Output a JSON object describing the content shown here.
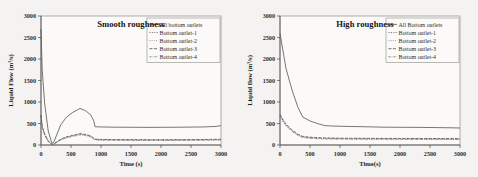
{
  "figure": {
    "background_color": "#f2f1ef",
    "panel_background": "#fbfaf9",
    "line_color": "#5d5d5d"
  },
  "panels": [
    {
      "id": "smooth",
      "title": "Smooth roughness",
      "xlabel": "Time (s)",
      "ylabel": "Liquid Flow (m³/s)",
      "xticks": [
        "0",
        "500",
        "1000",
        "1500",
        "2000",
        "2500",
        "3000"
      ],
      "yticks": [
        "0",
        "500",
        "1000",
        "1500",
        "2000",
        "2500",
        "3000"
      ],
      "legend": [
        "All bottom outlets",
        "Bottom outlet-1",
        "Bottom outlet-2",
        "Bottom outlet-3",
        "Bottom outlet-4"
      ]
    },
    {
      "id": "high",
      "title": "High roughness",
      "xlabel": "Time(s)",
      "ylabel": "Liquid flow (m³/s)",
      "xticks": [
        "0",
        "500",
        "1000",
        "1500",
        "2000",
        "2500",
        "3000"
      ],
      "yticks": [
        "0",
        "500",
        "1000",
        "1500",
        "2000",
        "2500",
        "3000"
      ],
      "legend": [
        "All Bottom outlets",
        "Bottom outlet-1",
        "Bottom outlet-2",
        "Bottom outlet-3",
        "Bottom outlet-4"
      ]
    }
  ],
  "chart_data": [
    {
      "type": "line",
      "title": "Smooth roughness",
      "xlabel": "Time (s)",
      "ylabel": "Liquid Flow (m³/s)",
      "xlim": [
        0,
        3000
      ],
      "ylim": [
        0,
        3000
      ],
      "xticks": [
        0,
        500,
        1000,
        1500,
        2000,
        2500,
        3000
      ],
      "yticks": [
        0,
        500,
        1000,
        1500,
        2000,
        2500,
        3000
      ],
      "grid": false,
      "legend_position": "top-right",
      "series": [
        {
          "name": "All bottom outlets",
          "x": [
            0,
            20,
            60,
            120,
            180,
            210,
            260,
            330,
            420,
            520,
            650,
            740,
            830,
            880,
            900,
            1000,
            1200,
            1500,
            1800,
            2100,
            2400,
            2700,
            2900,
            3000
          ],
          "y": [
            2700,
            1750,
            980,
            330,
            40,
            60,
            230,
            470,
            640,
            750,
            850,
            800,
            700,
            560,
            425,
            420,
            415,
            412,
            410,
            412,
            415,
            420,
            430,
            450
          ]
        },
        {
          "name": "Bottom outlet-1",
          "x": [
            0,
            20,
            60,
            120,
            180,
            210,
            260,
            330,
            420,
            520,
            650,
            740,
            830,
            900,
            1000,
            1200,
            1500,
            1800,
            2100,
            2400,
            2700,
            3000
          ],
          "y": [
            690,
            430,
            250,
            90,
            15,
            20,
            65,
            130,
            180,
            215,
            255,
            240,
            205,
            130,
            125,
            122,
            120,
            118,
            118,
            120,
            122,
            128
          ]
        },
        {
          "name": "Bottom outlet-2",
          "x": [
            0,
            20,
            60,
            120,
            180,
            210,
            260,
            330,
            420,
            520,
            650,
            740,
            830,
            900,
            1000,
            1200,
            1500,
            1800,
            2100,
            2400,
            2700,
            3000
          ],
          "y": [
            670,
            420,
            240,
            85,
            12,
            18,
            60,
            122,
            172,
            205,
            245,
            228,
            195,
            122,
            118,
            115,
            113,
            112,
            112,
            114,
            116,
            122
          ]
        },
        {
          "name": "Bottom outlet-3",
          "x": [
            0,
            20,
            60,
            120,
            180,
            210,
            260,
            330,
            420,
            520,
            650,
            740,
            830,
            900,
            1000,
            1200,
            1500,
            1800,
            2100,
            2400,
            2700,
            3000
          ],
          "y": [
            700,
            440,
            258,
            95,
            18,
            24,
            70,
            136,
            188,
            222,
            265,
            248,
            212,
            136,
            130,
            127,
            125,
            123,
            123,
            125,
            128,
            134
          ]
        },
        {
          "name": "Bottom outlet-4",
          "x": [
            0,
            20,
            60,
            120,
            180,
            210,
            260,
            330,
            420,
            520,
            650,
            740,
            830,
            900,
            1000,
            1200,
            1500,
            1800,
            2100,
            2400,
            2700,
            3000
          ],
          "y": [
            660,
            412,
            232,
            80,
            10,
            15,
            56,
            116,
            165,
            198,
            236,
            220,
            188,
            116,
            112,
            109,
            107,
            106,
            106,
            108,
            110,
            116
          ]
        }
      ]
    },
    {
      "type": "line",
      "title": "High roughness",
      "xlabel": "Time(s)",
      "ylabel": "Liquid flow (m³/s)",
      "xlim": [
        0,
        3000
      ],
      "ylim": [
        0,
        3000
      ],
      "xticks": [
        0,
        500,
        1000,
        1500,
        2000,
        2500,
        3000
      ],
      "yticks": [
        0,
        500,
        1000,
        1500,
        2000,
        2500,
        3000
      ],
      "grid": false,
      "legend_position": "top-right",
      "series": [
        {
          "name": "All Bottom outlets",
          "x": [
            0,
            30,
            100,
            200,
            300,
            380,
            500,
            620,
            750,
            900,
            1100,
            1400,
            1700,
            2000,
            2300,
            2600,
            2850,
            3000
          ],
          "y": [
            2600,
            2350,
            1780,
            1280,
            870,
            650,
            560,
            500,
            450,
            440,
            432,
            425,
            415,
            412,
            410,
            405,
            400,
            395
          ]
        },
        {
          "name": "Bottom outlet-1",
          "x": [
            0,
            30,
            100,
            200,
            300,
            380,
            500,
            620,
            750,
            900,
            1100,
            1400,
            1700,
            2000,
            2300,
            2600,
            2850,
            3000
          ],
          "y": [
            700,
            620,
            470,
            340,
            240,
            190,
            172,
            162,
            155,
            152,
            150,
            148,
            146,
            145,
            144,
            143,
            142,
            140
          ]
        },
        {
          "name": "Bottom outlet-2",
          "x": [
            0,
            30,
            100,
            200,
            300,
            380,
            500,
            620,
            750,
            900,
            1100,
            1400,
            1700,
            2000,
            2300,
            2600,
            2850,
            3000
          ],
          "y": [
            685,
            605,
            455,
            328,
            230,
            180,
            163,
            153,
            147,
            144,
            142,
            140,
            139,
            138,
            137,
            136,
            135,
            134
          ]
        },
        {
          "name": "Bottom outlet-3",
          "x": [
            0,
            30,
            100,
            200,
            300,
            380,
            500,
            620,
            750,
            900,
            1100,
            1400,
            1700,
            2000,
            2300,
            2600,
            2850,
            3000
          ],
          "y": [
            715,
            635,
            485,
            352,
            250,
            200,
            182,
            172,
            165,
            161,
            158,
            156,
            154,
            153,
            152,
            151,
            150,
            148
          ]
        },
        {
          "name": "Bottom outlet-4",
          "x": [
            0,
            30,
            100,
            200,
            300,
            380,
            500,
            620,
            750,
            900,
            1100,
            1400,
            1700,
            2000,
            2300,
            2600,
            2850,
            3000
          ],
          "y": [
            672,
            592,
            443,
            316,
            220,
            172,
            155,
            146,
            140,
            137,
            135,
            133,
            132,
            131,
            130,
            129,
            128,
            127
          ]
        }
      ]
    }
  ]
}
